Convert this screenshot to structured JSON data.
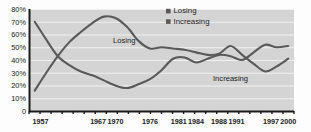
{
  "chart_data": {
    "type": "line",
    "title": "",
    "subtitle": "",
    "xlabel": "",
    "ylabel": "",
    "xlim": [
      1955,
      2001
    ],
    "ylim": [
      0,
      80
    ],
    "grid": true,
    "grid_axis": "y",
    "legend_position": "top-center",
    "y_ticks": [
      {
        "value": 80,
        "label": "80%"
      },
      {
        "value": 70,
        "label": "70%"
      },
      {
        "value": 60,
        "label": "60%"
      },
      {
        "value": 50,
        "label": "50%"
      },
      {
        "value": 40,
        "label": "40%"
      },
      {
        "value": 30,
        "label": "30%"
      },
      {
        "value": 20,
        "label": "20%"
      },
      {
        "value": 10,
        "label": "10%"
      },
      {
        "value": 0,
        "label": "0"
      }
    ],
    "x_ticks": [
      {
        "value": 1957,
        "label": "1957"
      },
      {
        "value": 1967,
        "label": "1967"
      },
      {
        "value": 1970,
        "label": "1970"
      },
      {
        "value": 1976,
        "label": "1976"
      },
      {
        "value": 1981,
        "label": "1981"
      },
      {
        "value": 1984,
        "label": "1984"
      },
      {
        "value": 1988,
        "label": "1988"
      },
      {
        "value": 1991,
        "label": "1991"
      },
      {
        "value": 1997,
        "label": "1997"
      },
      {
        "value": 2000,
        "label": "2000"
      }
    ],
    "x": [
      1956,
      1958,
      1960,
      1962,
      1964,
      1966,
      1968,
      1970,
      1972,
      1974,
      1976,
      1978,
      1980,
      1982,
      1984,
      1986,
      1988,
      1990,
      1992,
      1994,
      1996,
      1998,
      2000
    ],
    "series": [
      {
        "name": "Losing",
        "color": "#595959",
        "values": [
          70,
          56,
          43,
          36,
          31,
          28,
          24,
          20,
          18,
          21,
          25,
          32,
          41,
          42,
          38,
          41,
          44,
          43,
          40,
          46,
          52,
          50,
          51
        ]
      },
      {
        "name": "Increasing",
        "color": "#595959",
        "values": [
          16,
          30,
          43,
          54,
          62,
          69,
          74,
          73,
          66,
          55,
          49,
          50,
          49,
          48,
          46,
          44,
          45,
          51,
          44,
          37,
          31,
          35,
          41
        ]
      }
    ],
    "annotations": [
      {
        "text": "Losing",
        "series": "Losing"
      },
      {
        "text": "Increasing",
        "series": "Increasing"
      }
    ]
  },
  "legend": {
    "items": [
      {
        "label": "Losing",
        "color": "#595959"
      },
      {
        "label": "Increasing",
        "color": "#595959"
      }
    ]
  },
  "style": {
    "plot_background": "#d4d4d4",
    "grid_color": "#f0f0f0",
    "axis_color": "#1a1a1a",
    "line_color": "#595959",
    "text_color": "#1a1a1a"
  }
}
